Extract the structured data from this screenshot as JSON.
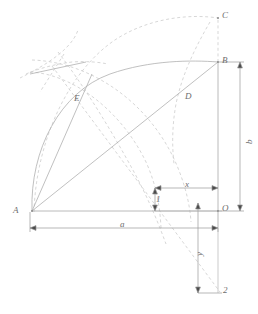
{
  "figure": {
    "type": "geometric-construction-diagram",
    "background_color": "#ffffff",
    "line_color": "#b9b9b9",
    "solid_line_color": "#a8a8a8",
    "dimension_line_color": "#909090",
    "label_color": "#6d6d6d",
    "width": 258,
    "height": 314
  },
  "points": {
    "A": {
      "label": "A",
      "x": 32,
      "y": 211,
      "text_x": 13,
      "text_y": 206
    },
    "B": {
      "label": "B",
      "x": 218,
      "y": 62,
      "text_x": 222,
      "text_y": 58
    },
    "C": {
      "label": "C",
      "x": 218,
      "y": 18,
      "text_x": 222,
      "text_y": 13
    },
    "D": {
      "label": "D",
      "x": 184,
      "y": 92,
      "text_x": 185,
      "text_y": 93
    },
    "E": {
      "label": "E",
      "x": 76,
      "y": 98,
      "text_x": 74,
      "text_y": 95
    },
    "O": {
      "label": "O",
      "x": 218,
      "y": 211,
      "text_x": 222,
      "text_y": 205
    },
    "one": {
      "label": "1",
      "x": 155,
      "y": 200,
      "text_x": 156,
      "text_y": 196
    },
    "two": {
      "label": "2",
      "x": 222,
      "y": 293,
      "text_x": 222,
      "text_y": 287
    }
  },
  "dimensions": {
    "a": {
      "label": "a",
      "text_x": 120,
      "text_y": 222,
      "from_x": 30,
      "to_x": 218,
      "y": 228
    },
    "b": {
      "label": "b",
      "text_x": 243,
      "text_y": 140,
      "x": 240,
      "from_y": 62,
      "to_y": 211
    },
    "x": {
      "label": "x",
      "text_x": 185,
      "text_y": 182,
      "from_x": 155,
      "to_x": 218,
      "y": 188
    },
    "y": {
      "label": "y",
      "text_x": 193,
      "text_y": 253,
      "x": 198,
      "from_y": 203,
      "to_y": 293
    },
    "one_vertical": {
      "label": "1",
      "x": 155,
      "from_y": 188,
      "to_y": 211
    }
  },
  "elements": {
    "segment_AB": "solid line from A to B",
    "segment_AO": "solid horizontal baseline from A to O",
    "segment_BO": "vertical line from B down to O",
    "segment_BC": "dashed vertical line from B up to C",
    "arc_AEB": "solid curve from A through E to B",
    "arc_large_dashed": "dashed arc sweeping to C",
    "arc_center_A": "dashed circular arc centered near A",
    "diagonal_dashed": "dashed diagonal line from upper-left through O region to point 2"
  }
}
